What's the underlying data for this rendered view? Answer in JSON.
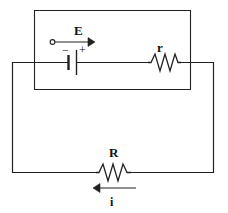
{
  "figure": {
    "stroke_color": "#222222",
    "background_color": "#ffffff",
    "width": 228,
    "height": 213
  },
  "labels": {
    "emf": "E",
    "internal_resistance": "r",
    "load_resistance": "R",
    "current": "i",
    "battery_negative": "−",
    "battery_positive": "+"
  },
  "components": [
    {
      "id": "battery",
      "name": "battery-emf-source",
      "label": "E",
      "terminals": {
        "left": "−",
        "right": "+"
      },
      "position": {
        "x": 72,
        "y": 62
      }
    },
    {
      "id": "internal-resistor",
      "name": "resistor-internal",
      "label": "r",
      "zigzag_peaks": 3,
      "position": {
        "x": 164,
        "y": 62
      }
    },
    {
      "id": "load-resistor",
      "name": "resistor-load",
      "label": "R",
      "zigzag_peaks": 3,
      "position": {
        "x": 113,
        "y": 173
      }
    }
  ],
  "annotations": [
    {
      "id": "emf-arrow",
      "name": "emf-direction-arrow",
      "label": "E",
      "direction": "right",
      "start_marker": "open-circle",
      "from": {
        "x": 51,
        "y": 42
      },
      "to": {
        "x": 92,
        "y": 42
      }
    },
    {
      "id": "current-arrow",
      "name": "current-direction-arrow",
      "label": "i",
      "direction": "left",
      "from": {
        "x": 133,
        "y": 188
      },
      "to": {
        "x": 95,
        "y": 188
      }
    }
  ],
  "loops": {
    "inner_rectangle": {
      "x1": 34,
      "y1": 10,
      "x2": 191,
      "y2": 90
    },
    "outer_rectangle": {
      "x1": 12,
      "y1": 62,
      "x2": 214,
      "y2": 173
    }
  }
}
